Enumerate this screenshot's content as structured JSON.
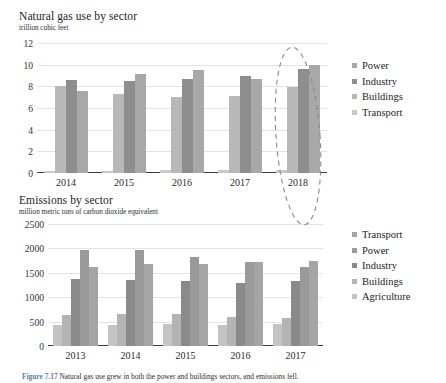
{
  "figure": {
    "caption_label": "Figure 7.17",
    "caption_text": "Natural gas use grew in both the power and buildings sectors, and emissions fell."
  },
  "annotation": {
    "name": "dashed-ellipse-highlight",
    "target_year": "2018",
    "color": "#8a8a8a"
  },
  "charts": [
    {
      "id": "natural-gas-use",
      "title": "Natural gas use by sector",
      "subtitle": "trillion cubic feet",
      "legend": [
        {
          "label": "Power",
          "color": "#a8a8a8"
        },
        {
          "label": "Industry",
          "color": "#8e8e8e"
        },
        {
          "label": "Buildings",
          "color": "#b8b8b8"
        },
        {
          "label": "Transport",
          "color": "#c9c9c9"
        }
      ]
    },
    {
      "id": "emissions-by-sector",
      "title": "Emissions by sector",
      "subtitle": "million metric tons of carbon dioxide equivalent",
      "legend": [
        {
          "label": "Transport",
          "color": "#a5a5a5"
        },
        {
          "label": "Power",
          "color": "#9a9a9a"
        },
        {
          "label": "Industry",
          "color": "#8a8a8a"
        },
        {
          "label": "Buildings",
          "color": "#b4b4b4"
        },
        {
          "label": "Agriculture",
          "color": "#c4c4c4"
        }
      ]
    }
  ],
  "chart_data": [
    {
      "type": "bar",
      "id": "natural-gas-use",
      "title": "Natural gas use by sector",
      "subtitle": "trillion cubic feet",
      "xlabel": "",
      "ylabel": "trillion cubic feet",
      "ylim": [
        0,
        12
      ],
      "yticks": [
        0,
        2,
        4,
        6,
        8,
        10,
        12
      ],
      "grid": true,
      "legend_position": "right",
      "categories": [
        "2014",
        "2015",
        "2016",
        "2017",
        "2018"
      ],
      "bar_order": [
        "Transport",
        "Buildings",
        "Industry",
        "Power"
      ],
      "series": [
        {
          "name": "Transport",
          "color": "#c9c9c9",
          "values": [
            0.2,
            0.22,
            0.25,
            0.27,
            0.32
          ]
        },
        {
          "name": "Buildings",
          "color": "#b8b8b8",
          "values": [
            8.0,
            7.3,
            7.0,
            7.1,
            7.9
          ]
        },
        {
          "name": "Industry",
          "color": "#8e8e8e",
          "values": [
            8.6,
            8.5,
            8.7,
            9.0,
            9.6
          ]
        },
        {
          "name": "Power",
          "color": "#a8a8a8",
          "values": [
            7.6,
            9.1,
            9.5,
            8.7,
            10.0
          ]
        }
      ]
    },
    {
      "type": "bar",
      "id": "emissions-by-sector",
      "title": "Emissions by sector",
      "subtitle": "million metric tons of carbon dioxide equivalent",
      "xlabel": "",
      "ylabel": "million metric tons of carbon dioxide equivalent",
      "ylim": [
        0,
        2500
      ],
      "yticks": [
        0,
        500,
        1000,
        1500,
        2000,
        2500
      ],
      "grid": true,
      "legend_position": "right",
      "categories": [
        "2013",
        "2014",
        "2015",
        "2016",
        "2017"
      ],
      "bar_order": [
        "Agriculture",
        "Buildings",
        "Industry",
        "Power",
        "Transport"
      ],
      "series": [
        {
          "name": "Agriculture",
          "color": "#c4c4c4",
          "values": [
            430,
            440,
            450,
            440,
            450
          ]
        },
        {
          "name": "Buildings",
          "color": "#b4b4b4",
          "values": [
            630,
            660,
            650,
            600,
            580
          ]
        },
        {
          "name": "Industry",
          "color": "#8a8a8a",
          "values": [
            1380,
            1360,
            1340,
            1300,
            1330
          ]
        },
        {
          "name": "Power",
          "color": "#9a9a9a",
          "values": [
            1960,
            1960,
            1820,
            1730,
            1620
          ]
        },
        {
          "name": "Transport",
          "color": "#a5a5a5",
          "values": [
            1620,
            1680,
            1680,
            1730,
            1740
          ]
        }
      ]
    }
  ]
}
